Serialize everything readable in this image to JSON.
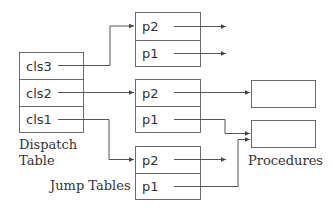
{
  "diagram": {
    "dispatch_table": {
      "label_line1": "Dispatch",
      "label_line2": "Table",
      "rows": [
        {
          "label": "cls3"
        },
        {
          "label": "cls2"
        },
        {
          "label": "cls1"
        }
      ]
    },
    "jump_tables": {
      "label": "Jump Tables",
      "tables": [
        {
          "rows": [
            {
              "label": "p2"
            },
            {
              "label": "p1"
            }
          ]
        },
        {
          "rows": [
            {
              "label": "p2"
            },
            {
              "label": "p1"
            }
          ]
        },
        {
          "rows": [
            {
              "label": "p2"
            },
            {
              "label": "p1"
            }
          ]
        }
      ]
    },
    "procedures": {
      "label": "Procedures",
      "count": 2
    },
    "edges": [
      {
        "from": "cls3",
        "to": "jump-table-1.p2"
      },
      {
        "from": "cls2",
        "to": "jump-table-2.p2"
      },
      {
        "from": "cls1",
        "to": "jump-table-3.p2"
      },
      {
        "from": "jump-table-1.p2",
        "to": "external"
      },
      {
        "from": "jump-table-1.p1",
        "to": "external"
      },
      {
        "from": "jump-table-2.p2",
        "to": "procedure-1"
      },
      {
        "from": "jump-table-2.p1",
        "to": "procedure-2"
      },
      {
        "from": "jump-table-3.p2",
        "to": "external"
      },
      {
        "from": "jump-table-3.p1",
        "to": "procedure-2"
      }
    ],
    "colors": {
      "stroke": "#6b6b6b",
      "text": "#333333"
    }
  }
}
